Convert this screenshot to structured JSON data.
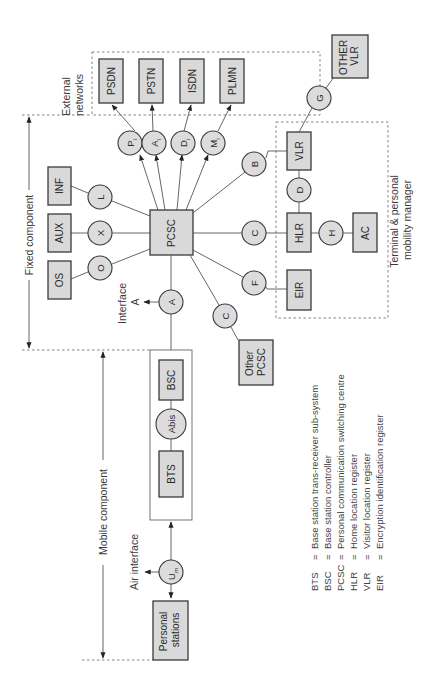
{
  "diagram": {
    "orientation": "rotated 90 degrees counter-clockwise",
    "regions": {
      "fixed_component": "Fixed component",
      "mobile_component": "Mobile component",
      "external_networks": [
        "External",
        "networks"
      ],
      "terminal_manager": [
        "Terminal & personal",
        "mobility manager"
      ]
    },
    "external_networks": [
      "PSDN",
      "PSTN",
      "ISDN",
      "PLMN"
    ],
    "external_interfaces": [
      {
        "main": "P",
        "sub": "i"
      },
      {
        "main": "A",
        "sub": "i"
      },
      {
        "main": "D",
        "sub": "i"
      },
      {
        "main": "M",
        "sub": "i"
      }
    ],
    "central": "PCSC",
    "support_systems": [
      {
        "box": "INF",
        "interface": "L"
      },
      {
        "box": "AUX",
        "interface": "X"
      },
      {
        "box": "OS",
        "interface": "O"
      }
    ],
    "interface_a": {
      "circle": "A",
      "label": "Interface",
      "target": "A"
    },
    "mobile": {
      "bsc": "BSC",
      "abis": "Abis",
      "bts": "BTS",
      "air_interface": "Air interface",
      "um": {
        "main": "U",
        "sub": "m"
      },
      "stations": [
        "Personal",
        "stations"
      ]
    },
    "registers": {
      "b": "B",
      "vlr": "VLR",
      "d": "D",
      "c_hlr": "C",
      "hlr": "HLR",
      "h": "H",
      "ac": "AC",
      "f": "F",
      "eir": "EIR",
      "g": "G",
      "other_vlr": [
        "OTHER",
        "VLR"
      ],
      "c_other": "C",
      "other_pcsc": [
        "Other",
        "PCSC"
      ]
    },
    "legend": [
      {
        "abbr": "BTS",
        "eq": "=",
        "desc": "Base station trans-receiver sub-system"
      },
      {
        "abbr": "BSC",
        "eq": "=",
        "desc": "Base station controller"
      },
      {
        "abbr": "PCSC",
        "eq": "=",
        "desc": "Personal communication switching centre"
      },
      {
        "abbr": "HLR",
        "eq": "=",
        "desc": "Home location register"
      },
      {
        "abbr": "VLR",
        "eq": "=",
        "desc": "Visitor location register"
      },
      {
        "abbr": "EIR",
        "eq": "=",
        "desc": "Encryption identification register"
      }
    ]
  }
}
